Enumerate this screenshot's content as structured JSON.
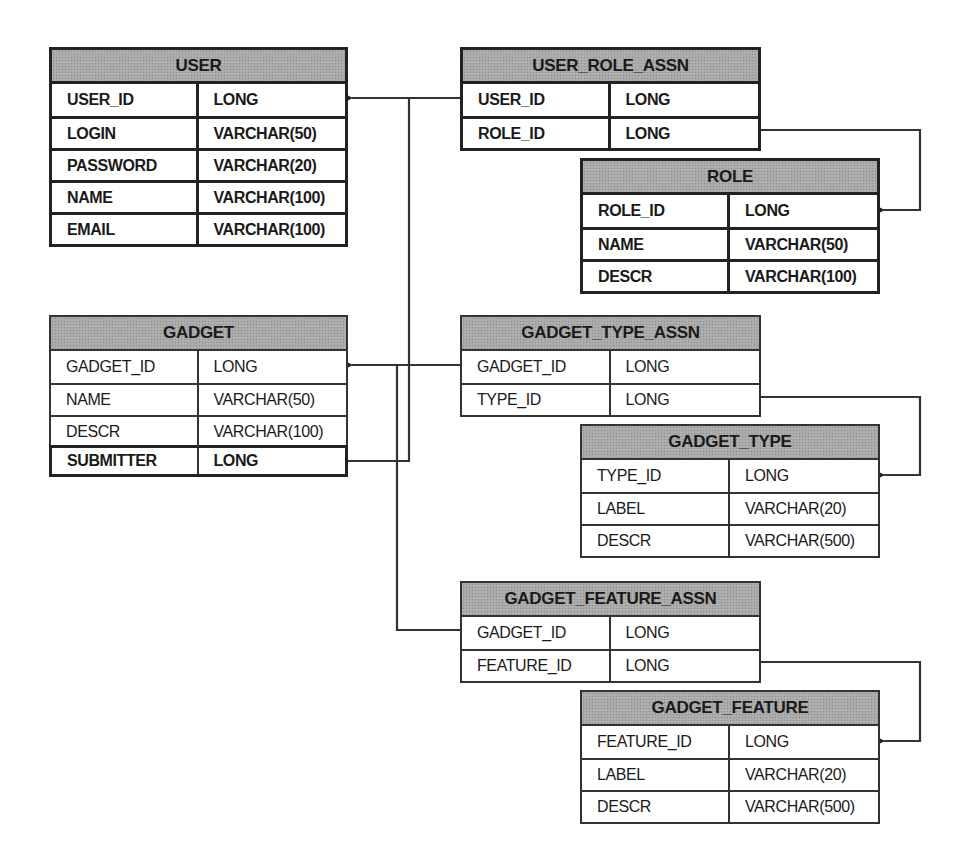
{
  "diagram": {
    "type": "entity-relationship",
    "tables": [
      {
        "id": "user",
        "name": "USER",
        "style": "bold",
        "columns": [
          {
            "name": "USER_ID",
            "type": "LONG"
          },
          {
            "name": "LOGIN",
            "type": "VARCHAR(50)"
          },
          {
            "name": "PASSWORD",
            "type": "VARCHAR(20)"
          },
          {
            "name": "NAME",
            "type": "VARCHAR(100)"
          },
          {
            "name": "EMAIL",
            "type": "VARCHAR(100)"
          }
        ]
      },
      {
        "id": "user_role_assn",
        "name": "USER_ROLE_ASSN",
        "style": "bold",
        "columns": [
          {
            "name": "USER_ID",
            "type": "LONG"
          },
          {
            "name": "ROLE_ID",
            "type": "LONG"
          }
        ]
      },
      {
        "id": "role",
        "name": "ROLE",
        "style": "bold",
        "columns": [
          {
            "name": "ROLE_ID",
            "type": "LONG"
          },
          {
            "name": "NAME",
            "type": "VARCHAR(50)"
          },
          {
            "name": "DESCR",
            "type": "VARCHAR(100)"
          }
        ]
      },
      {
        "id": "gadget",
        "name": "GADGET",
        "style": "thin",
        "columns": [
          {
            "name": "GADGET_ID",
            "type": "LONG"
          },
          {
            "name": "NAME",
            "type": "VARCHAR(50)"
          },
          {
            "name": "DESCR",
            "type": "VARCHAR(100)"
          },
          {
            "name": "SUBMITTER",
            "type": "LONG",
            "emphasized": true
          }
        ]
      },
      {
        "id": "gadget_type_assn",
        "name": "GADGET_TYPE_ASSN",
        "style": "thin",
        "columns": [
          {
            "name": "GADGET_ID",
            "type": "LONG"
          },
          {
            "name": "TYPE_ID",
            "type": "LONG"
          }
        ]
      },
      {
        "id": "gadget_type",
        "name": "GADGET_TYPE",
        "style": "thin",
        "columns": [
          {
            "name": "TYPE_ID",
            "type": "LONG"
          },
          {
            "name": "LABEL",
            "type": "VARCHAR(20)"
          },
          {
            "name": "DESCR",
            "type": "VARCHAR(500)"
          }
        ]
      },
      {
        "id": "gadget_feature_assn",
        "name": "GADGET_FEATURE_ASSN",
        "style": "thin",
        "columns": [
          {
            "name": "GADGET_ID",
            "type": "LONG"
          },
          {
            "name": "FEATURE_ID",
            "type": "LONG"
          }
        ]
      },
      {
        "id": "gadget_feature",
        "name": "GADGET_FEATURE",
        "style": "thin",
        "columns": [
          {
            "name": "FEATURE_ID",
            "type": "LONG"
          },
          {
            "name": "LABEL",
            "type": "VARCHAR(20)"
          },
          {
            "name": "DESCR",
            "type": "VARCHAR(500)"
          }
        ]
      }
    ],
    "relationships": [
      {
        "from": "USER_ROLE_ASSN.USER_ID",
        "to": "USER.USER_ID"
      },
      {
        "from": "GADGET.SUBMITTER",
        "to": "USER.USER_ID"
      },
      {
        "from": "USER_ROLE_ASSN.ROLE_ID",
        "to": "ROLE.ROLE_ID"
      },
      {
        "from": "GADGET_TYPE_ASSN.GADGET_ID",
        "to": "GADGET.GADGET_ID"
      },
      {
        "from": "GADGET_FEATURE_ASSN.GADGET_ID",
        "to": "GADGET.GADGET_ID"
      },
      {
        "from": "GADGET_TYPE_ASSN.TYPE_ID",
        "to": "GADGET_TYPE.TYPE_ID"
      },
      {
        "from": "GADGET_FEATURE_ASSN.FEATURE_ID",
        "to": "GADGET_FEATURE.FEATURE_ID"
      }
    ],
    "colors": {
      "header_fill": "#a9a9a9",
      "border": "#222222",
      "line": "#333333",
      "background": "#ffffff"
    }
  }
}
